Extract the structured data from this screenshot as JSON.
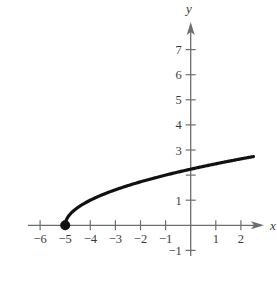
{
  "chart_data": {
    "type": "line",
    "title": "",
    "function": "y = sqrt(x + 5)",
    "xlabel": "x",
    "ylabel": "y",
    "xlim": [
      -6.5,
      2.9
    ],
    "ylim": [
      -1.5,
      7.9
    ],
    "grid": false,
    "legend": null,
    "x_ticks": [
      -6,
      -5,
      -4,
      -3,
      -2,
      -1,
      1,
      2
    ],
    "x_tick_labels": [
      "−6",
      "−5",
      "−4",
      "−3",
      "−2",
      "−1",
      "1",
      "2"
    ],
    "y_ticks": [
      -1,
      1,
      2,
      3,
      4,
      5,
      6,
      7
    ],
    "y_tick_labels": [
      "−1",
      "1",
      "",
      "3",
      "4",
      "5",
      "6",
      "7"
    ],
    "series": [
      {
        "name": "curve",
        "x": [
          -5,
          -4.9,
          -4.75,
          -4.5,
          -4,
          -3.5,
          -3,
          -2,
          -1,
          0,
          1,
          2,
          2.5
        ],
        "y": [
          0,
          0.316,
          0.5,
          0.707,
          1,
          1.225,
          1.414,
          1.732,
          2.449,
          2.236,
          2.449,
          2.646,
          2.739
        ]
      }
    ],
    "annotations": [
      {
        "type": "closed-point",
        "x": -5,
        "y": 0
      }
    ],
    "colors": {
      "axis": "#6e6e6e",
      "curve": "#111111",
      "text": "#3a3a3a"
    }
  }
}
